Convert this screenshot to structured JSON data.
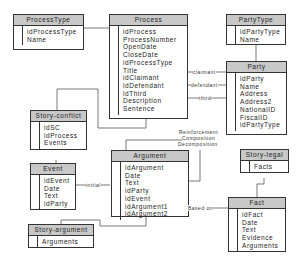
{
  "entities": {
    "processtype": {
      "title": "ProcessType",
      "fields": [
        "idProcessType",
        "Name"
      ]
    },
    "process": {
      "title": "Process",
      "fields": [
        "idProcess",
        "ProcessNumber",
        "OpenDate",
        "CloseDate",
        "idProcessType",
        "Title",
        "idClaimant",
        "idDefendant",
        "idThird",
        "Description",
        "Sentence"
      ]
    },
    "partytype": {
      "title": "PartyType",
      "fields": [
        "idPartyType",
        "Name"
      ]
    },
    "party": {
      "title": "Party",
      "fields": [
        "idParty",
        "Name",
        "Address",
        "Address2",
        "NationalID",
        "FiscalID",
        "idPartyType"
      ]
    },
    "storyconflict": {
      "title": "Story-conflict",
      "fields": [
        "idSC",
        "idProcess",
        "Events"
      ]
    },
    "event": {
      "title": "Event",
      "fields": [
        "idEvent",
        "Date",
        "Text",
        "idParty"
      ]
    },
    "argument": {
      "title": "Argument",
      "fields": [
        "idArgument",
        "Date",
        "Text",
        "idParty",
        "idEvent",
        "idArgument1",
        "idArgument2"
      ]
    },
    "storylegal": {
      "title": "Story-legal",
      "fields": [
        "Facts"
      ]
    },
    "fact": {
      "title": "Fact",
      "fields": [
        "idFact",
        "Date",
        "Text",
        "Evidence",
        "Arguments"
      ]
    },
    "storyargument": {
      "title": "Story-argument",
      "fields": [
        "Arguments"
      ]
    }
  },
  "relations": {
    "claimant": "claimant",
    "defendant": "defendant",
    "third": "third",
    "initial": "initial",
    "reinforcement": "Reinforcement",
    "composition": "Composition",
    "decomposition": "Decomposition",
    "based_on": "Based on"
  },
  "colors": {
    "header_fill": "#c8c8c8",
    "border": "#333333",
    "line": "#555555"
  }
}
